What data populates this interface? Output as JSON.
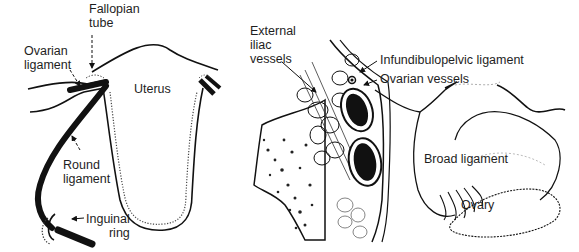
{
  "figure": {
    "panels": [
      {
        "id": "left",
        "description": "Frontal view of uterus with adnexal attachments",
        "labels": {
          "fallopian_tube_line1": "Fallopian",
          "fallopian_tube_line2": "tube",
          "ovarian_ligament_line1": "Ovarian",
          "ovarian_ligament_line2": "ligament",
          "uterus": "Uterus",
          "round_ligament_line1": "Round",
          "round_ligament_line2": "ligament",
          "inguinal_ring_line1": "Inguinal",
          "inguinal_ring_line2": "ring"
        }
      },
      {
        "id": "right",
        "description": "Pelvic side-wall view showing vessels and broad ligament",
        "labels": {
          "external_iliac_line1": "External",
          "external_iliac_line2": "iliac",
          "external_iliac_line3": "vessels",
          "infundibulopelvic": "Infundibulopelvic ligament",
          "ovarian_vessels": "Ovarian vessels",
          "broad_ligament": "Broad ligament",
          "ovary": "Ovary"
        }
      }
    ],
    "colors": {
      "ink": "#111111",
      "background": "#ffffff"
    }
  }
}
